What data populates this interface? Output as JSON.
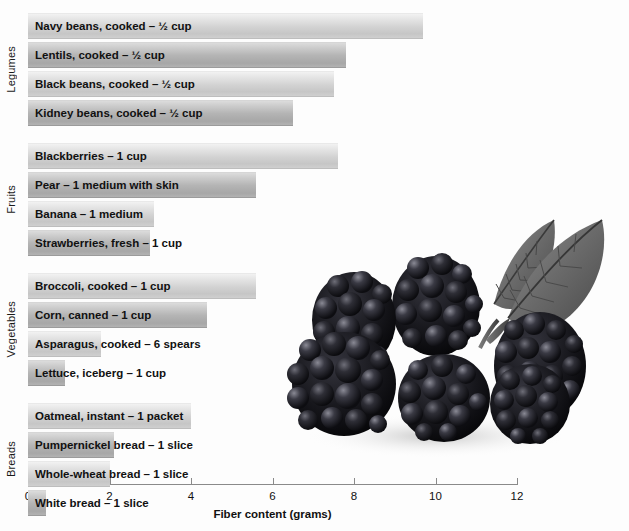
{
  "chart_data": {
    "type": "bar",
    "orientation": "horizontal",
    "title": "",
    "xlabel": "Fiber content (grams)",
    "ylabel": "",
    "xlim": [
      0,
      12
    ],
    "xticks": [
      0,
      2,
      4,
      6,
      8,
      10,
      12
    ],
    "grid": false,
    "legend": null,
    "groups": [
      {
        "name": "Legumes",
        "items": [
          {
            "label": "Navy beans, cooked – ½ cup",
            "value": 9.7,
            "shade": "light"
          },
          {
            "label": "Lentils, cooked – ½ cup",
            "value": 7.8,
            "shade": "dark"
          },
          {
            "label": "Black beans, cooked – ½ cup",
            "value": 7.5,
            "shade": "light"
          },
          {
            "label": "Kidney beans, cooked – ½ cup",
            "value": 6.5,
            "shade": "dark"
          }
        ]
      },
      {
        "name": "Fruits",
        "items": [
          {
            "label": "Blackberries – 1 cup",
            "value": 7.6,
            "shade": "light"
          },
          {
            "label": "Pear – 1 medium with skin",
            "value": 5.6,
            "shade": "dark"
          },
          {
            "label": "Banana – 1 medium",
            "value": 3.1,
            "shade": "light"
          },
          {
            "label": "Strawberries, fresh – 1 cup",
            "value": 3.0,
            "shade": "dark"
          }
        ]
      },
      {
        "name": "Vegetables",
        "items": [
          {
            "label": "Broccoli, cooked – 1 cup",
            "value": 5.6,
            "shade": "light"
          },
          {
            "label": "Corn, canned – 1 cup",
            "value": 4.4,
            "shade": "dark"
          },
          {
            "label": "Asparagus, cooked – 6 spears",
            "value": 1.8,
            "shade": "light"
          },
          {
            "label": "Lettuce, iceberg – 1 cup",
            "value": 0.9,
            "shade": "dark"
          }
        ]
      },
      {
        "name": "Breads",
        "items": [
          {
            "label": "Oatmeal, instant – 1 packet",
            "value": 4.0,
            "shade": "light"
          },
          {
            "label": "Pumpernickel bread – 1 slice",
            "value": 2.1,
            "shade": "dark"
          },
          {
            "label": "Whole-wheat bread – 1 slice",
            "value": 2.0,
            "shade": "light"
          },
          {
            "label": "White bread – 1 slice",
            "value": 0.45,
            "shade": "dark"
          }
        ]
      }
    ]
  },
  "photo": {
    "name": "blackberries-photograph",
    "alt": "Cluster of blackberries with leaves"
  },
  "colors": {
    "bar_light": "#d2d2d2",
    "bar_dark": "#b4b4b4",
    "axis": "#8a8a8a",
    "text": "#111111",
    "background": "#fdfdfd"
  }
}
